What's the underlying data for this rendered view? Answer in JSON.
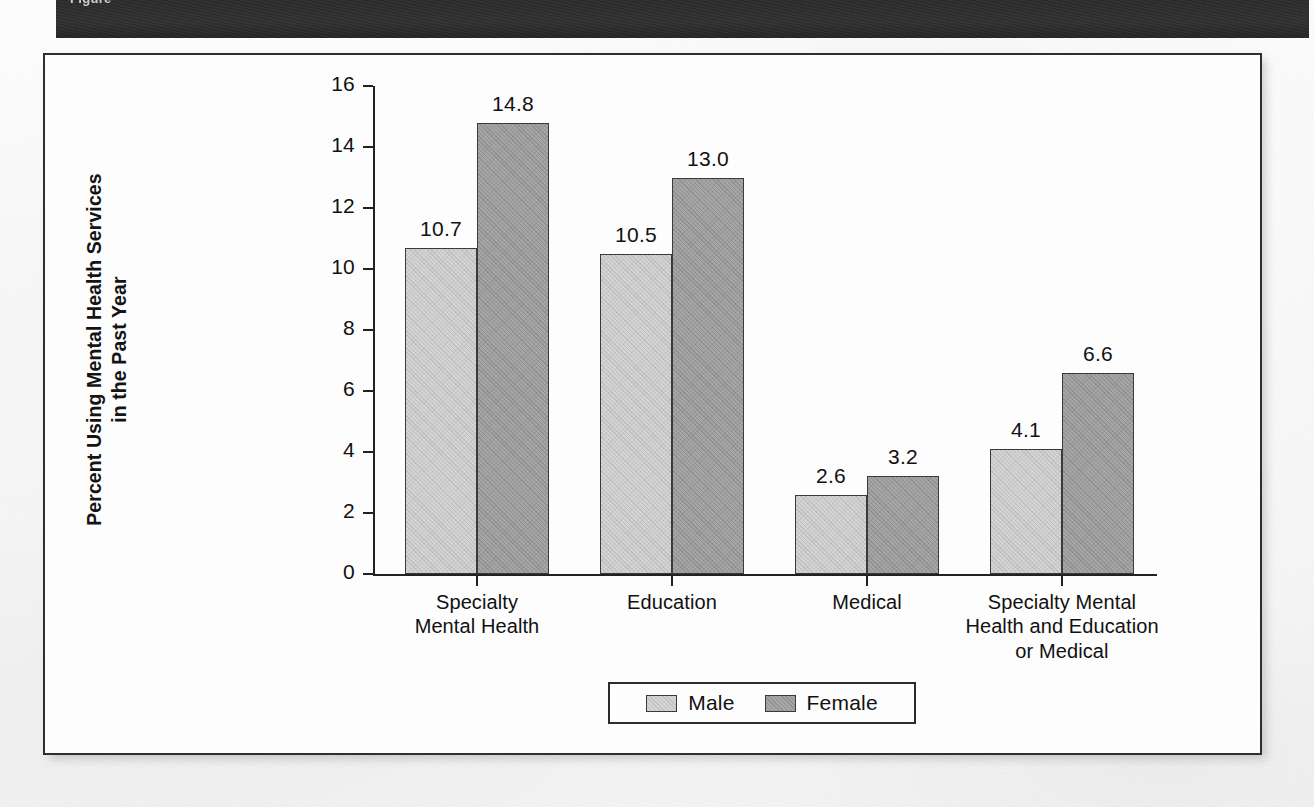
{
  "banner": {
    "text": "Figure"
  },
  "chart_data": {
    "type": "bar",
    "title": "",
    "subtitle": "",
    "xlabel": "",
    "ylabel": "Percent Using Mental Health Services in the Past Year",
    "ylabel_lines": [
      "Percent Using Mental Health Services",
      "in the Past Year"
    ],
    "ylim": [
      0,
      16
    ],
    "yticks": [
      0,
      2,
      4,
      6,
      8,
      10,
      12,
      14,
      16
    ],
    "ytick_labels": [
      "0",
      "2",
      "4",
      "6",
      "8",
      "10",
      "12",
      "14",
      "16"
    ],
    "grid": false,
    "legend_position": "bottom-center",
    "categories": [
      "Specialty Mental Health",
      "Education",
      "Medical",
      "Specialty Mental Health and Education or Medical"
    ],
    "category_lines": [
      [
        "Specialty",
        "Mental Health"
      ],
      [
        "Education"
      ],
      [
        "Medical"
      ],
      [
        "Specialty Mental",
        "Health and Education",
        "or Medical"
      ]
    ],
    "series": [
      {
        "name": "Male",
        "color": "#d4d4d4",
        "values": [
          10.7,
          10.5,
          2.6,
          4.1
        ],
        "labels": [
          "10.7",
          "10.5",
          "2.6",
          "4.1"
        ]
      },
      {
        "name": "Female",
        "color": "#a6a6a6",
        "values": [
          14.8,
          13.0,
          3.2,
          6.6
        ],
        "labels": [
          "14.8",
          "13.0",
          "3.2",
          "6.6"
        ]
      }
    ]
  }
}
